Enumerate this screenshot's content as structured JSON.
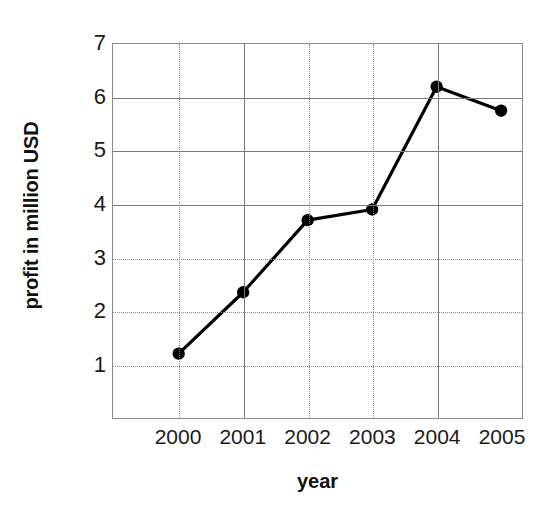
{
  "chart_data": {
    "type": "line",
    "title": "",
    "xlabel": "year",
    "ylabel": "profit in million USD",
    "categories": [
      "2000",
      "2001",
      "2002",
      "2003",
      "2004",
      "2005"
    ],
    "values": [
      1.2,
      2.35,
      3.7,
      3.9,
      6.2,
      5.75
    ],
    "series": [
      {
        "name": "profit",
        "values": [
          1.2,
          2.35,
          3.7,
          3.9,
          6.2,
          5.75
        ]
      }
    ],
    "x_tick_labels": [
      "2000",
      "2001",
      "2002",
      "2003",
      "2004",
      "2005"
    ],
    "y_tick_labels": [
      "1",
      "2",
      "3",
      "4",
      "5",
      "6",
      "7"
    ],
    "y_ticks": [
      1,
      2,
      3,
      4,
      5,
      6,
      7
    ],
    "ylim": [
      0,
      7
    ],
    "xlim": [
      2000,
      2005
    ],
    "grid": true,
    "legend": false,
    "legend_position": "none",
    "marker": "circle",
    "line_color": "#000000",
    "marker_color": "#000000",
    "grid_color": "#8a8a8a",
    "axis_color": "#8d8d8d",
    "background_color": "#ffffff"
  }
}
